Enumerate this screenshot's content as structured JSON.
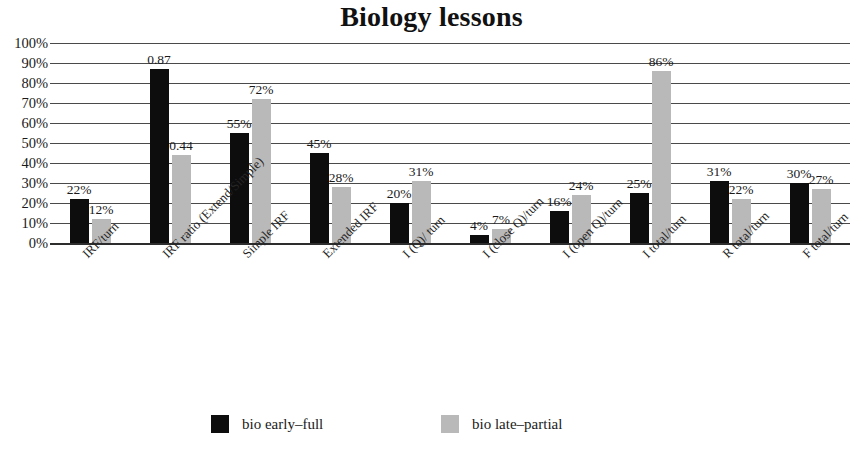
{
  "chart_data": {
    "type": "bar",
    "title": "Biology lessons",
    "xlabel": "",
    "ylabel": "",
    "ylim": [
      0,
      100
    ],
    "ytick_labels": [
      "100%",
      "90%",
      "80%",
      "70%",
      "60%",
      "50%",
      "40%",
      "30%",
      "20%",
      "10%",
      "0%"
    ],
    "ytick_values": [
      100,
      90,
      80,
      70,
      60,
      50,
      40,
      30,
      20,
      10,
      0
    ],
    "grid": true,
    "legend_position": "bottom",
    "categories": [
      "IRF/turn",
      "IRF ratio (Extend/Simple)",
      "Simple IRF",
      "Extended IRF",
      "I (Q)/ turn",
      "I (close Q)/turn",
      "I (open Q)/turn",
      "I total/turn",
      "R total/turn",
      "F total/turn"
    ],
    "series": [
      {
        "name": "bio early-full",
        "color": "#0d0d0d",
        "values": [
          22,
          87,
          55,
          45,
          20,
          4,
          16,
          25,
          31,
          30
        ],
        "labels": [
          "22%",
          "0.87",
          "55%",
          "45%",
          "20%",
          "4%",
          "16%",
          "25%",
          "31%",
          "30%"
        ]
      },
      {
        "name": "bio late-partial",
        "color": "#b9b9b9",
        "values": [
          12,
          44,
          72,
          28,
          31,
          7,
          24,
          86,
          22,
          27
        ],
        "labels": [
          "12%",
          "0.44",
          "72%",
          "28%",
          "31%",
          "7%",
          "24%",
          "86%",
          "22%",
          "27%"
        ]
      }
    ]
  },
  "legend": {
    "items": [
      {
        "label": "bio early–full",
        "color": "#0d0d0d"
      },
      {
        "label": "bio late–partial",
        "color": "#b9b9b9"
      }
    ]
  }
}
